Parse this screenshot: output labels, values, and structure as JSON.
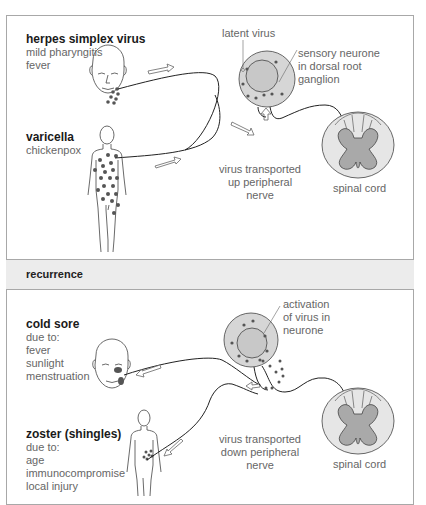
{
  "top_panel": {
    "hsv": {
      "title": "herpes simplex virus",
      "lines": [
        "mild pharyngitis",
        "fever"
      ]
    },
    "varicella": {
      "title": "varicella",
      "lines": [
        "chickenpox"
      ]
    },
    "latent_label": "latent virus",
    "neurone_label": [
      "sensory neurone",
      "in dorsal root",
      "ganglion"
    ],
    "transport_label": [
      "virus transported",
      "up peripheral",
      "nerve"
    ],
    "spinal_label": "spinal cord"
  },
  "band": {
    "label": "recurrence"
  },
  "bottom_panel": {
    "cold_sore": {
      "title": "cold sore",
      "lines": [
        "due to:",
        "fever",
        "sunlight",
        "menstruation"
      ]
    },
    "zoster": {
      "title": "zoster (shingles)",
      "lines": [
        "due to:",
        "age",
        "immunocompromise",
        "local injury"
      ]
    },
    "activation_label": [
      "activation",
      "of virus in",
      "neurone"
    ],
    "transport_label": [
      "virus transported",
      "down peripheral",
      "nerve"
    ],
    "spinal_label": "spinal cord"
  },
  "colors": {
    "border": "#a8a8a8",
    "band_bg": "#ececec",
    "neurone_fill": "#d6d6d6",
    "grey_matter": "#a9a9a9",
    "cord_white": "#e6e6e6",
    "dot": "#555555"
  }
}
